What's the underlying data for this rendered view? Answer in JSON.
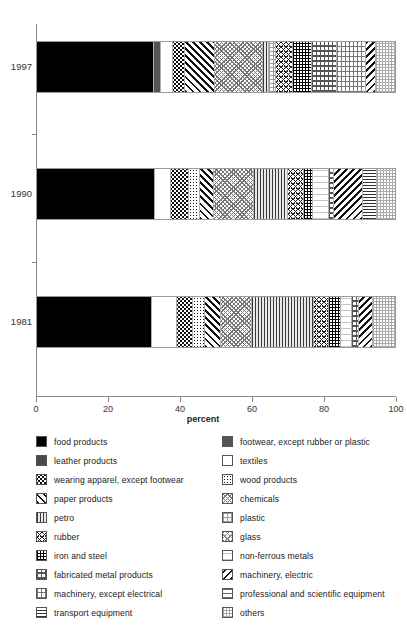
{
  "chart_data": {
    "type": "bar",
    "orientation": "horizontal",
    "stacked": true,
    "normalized": true,
    "title": "",
    "xlabel": "percent",
    "ylabel": "",
    "xlim": [
      0,
      100
    ],
    "xticks": [
      0,
      20,
      40,
      60,
      80,
      100
    ],
    "xticklabels": [
      "0",
      "20",
      "40",
      "60",
      "80",
      "100"
    ],
    "categories": [
      "1997",
      "1990",
      "1981"
    ],
    "grid": false,
    "legend_position": "below",
    "series": [
      {
        "name": "food products",
        "key": "food",
        "values": [
          31.5,
          33.0,
          32.0
        ]
      },
      {
        "name": "footwear, except rubber or plastic",
        "key": "footwear",
        "values": [
          1.8,
          0.0,
          0.0
        ]
      },
      {
        "name": "leather products",
        "key": "leather",
        "values": [
          0.0,
          0.0,
          0.0
        ]
      },
      {
        "name": "textiles",
        "key": "textiles",
        "values": [
          3.3,
          4.5,
          7.0
        ]
      },
      {
        "name": "wearing apparel, except footwear",
        "key": "apparel",
        "values": [
          3.3,
          5.0,
          4.5
        ]
      },
      {
        "name": "wood products",
        "key": "wood",
        "values": [
          0.0,
          3.0,
          3.5
        ]
      },
      {
        "name": "paper products",
        "key": "paper",
        "values": [
          8.0,
          4.0,
          4.5
        ]
      },
      {
        "name": "chemicals",
        "key": "chem",
        "values": [
          13.0,
          11.0,
          8.5
        ]
      },
      {
        "name": "petro",
        "key": "petro",
        "values": [
          1.7,
          9.5,
          17.5
        ]
      },
      {
        "name": "plastic",
        "key": "plastic",
        "values": [
          1.9,
          0.0,
          0.0
        ]
      },
      {
        "name": "rubber",
        "key": "rubber",
        "values": [
          4.4,
          4.5,
          4.0
        ]
      },
      {
        "name": "glass",
        "key": "glass",
        "values": [
          0.0,
          0.0,
          0.0
        ]
      },
      {
        "name": "iron and steel",
        "key": "iron",
        "values": [
          5.3,
          2.5,
          3.5
        ]
      },
      {
        "name": "non-ferrous metals",
        "key": "nonferrous",
        "values": [
          0.0,
          4.5,
          3.0
        ]
      },
      {
        "name": "fabricated metal products",
        "key": "fabmetal",
        "values": [
          6.7,
          1.5,
          2.0
        ]
      },
      {
        "name": "machinery, except electrical",
        "key": "machother",
        "values": [
          7.8,
          0.0,
          0.0
        ]
      },
      {
        "name": "machinery, electric",
        "key": "machelec",
        "values": [
          2.8,
          8.0,
          4.0
        ]
      },
      {
        "name": "professional and scientific equipment",
        "key": "prof",
        "values": [
          0.0,
          0.0,
          0.0
        ]
      },
      {
        "name": "transport equipment",
        "key": "transport",
        "values": [
          0.0,
          4.0,
          0.0
        ]
      },
      {
        "name": "others",
        "key": "others",
        "values": [
          5.0,
          5.0,
          6.0
        ]
      }
    ]
  },
  "axis": {
    "xlabel": "percent",
    "ticklabels": [
      "0",
      "20",
      "40",
      "60",
      "80",
      "100"
    ],
    "year_labels": [
      "1997",
      "1990",
      "1981"
    ]
  },
  "legend": {
    "left_column": [
      {
        "label": "food products",
        "swatch": "food"
      },
      {
        "label": "leather products",
        "swatch": "leather"
      },
      {
        "label": "wearing apparel, except footwear",
        "swatch": "apparel"
      },
      {
        "label": "paper products",
        "swatch": "paper"
      },
      {
        "label": "petro",
        "swatch": "petro"
      },
      {
        "label": "rubber",
        "swatch": "rubber"
      },
      {
        "label": "iron and steel",
        "swatch": "iron"
      },
      {
        "label": "fabricated metal products",
        "swatch": "fabmetal"
      },
      {
        "label": "machinery, except electrical",
        "swatch": "machother"
      },
      {
        "label": "transport equipment",
        "swatch": "transport"
      }
    ],
    "right_column": [
      {
        "label": "footwear, except rubber or plastic",
        "swatch": "footwear"
      },
      {
        "label": "textiles",
        "swatch": "textiles"
      },
      {
        "label": "wood products",
        "swatch": "wood"
      },
      {
        "label": "chemicals",
        "swatch": "chem"
      },
      {
        "label": "plastic",
        "swatch": "plastic"
      },
      {
        "label": "glass",
        "swatch": "glass"
      },
      {
        "label": "non-ferrous metals",
        "swatch": "nonferrous"
      },
      {
        "label": "machinery, electric",
        "swatch": "machelec"
      },
      {
        "label": "professional and scientific equipment",
        "swatch": "prof"
      },
      {
        "label": "others",
        "swatch": "others"
      }
    ]
  },
  "colors": {
    "axis": "#8a8a8a",
    "text": "#222222",
    "bar_border": "#9a9a9a",
    "background": "#ffffff"
  }
}
